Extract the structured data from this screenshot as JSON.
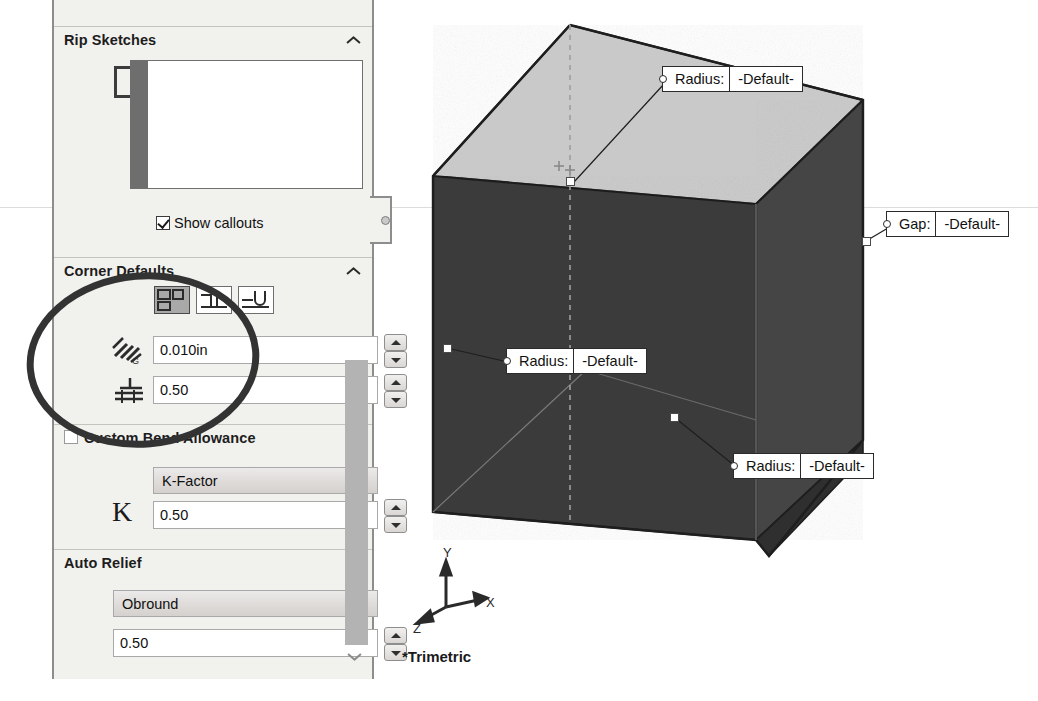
{
  "panel": {
    "name": "Sheet Metal PropertyManager",
    "groups": [
      {
        "id": "rip-sketches",
        "title": "Rip Sketches",
        "collapse_icon": "chevron-up-icon",
        "selection_icon": "rip-sketch-icon",
        "selection_box_value": "",
        "checkbox": {
          "label": "Show callouts",
          "checked": true
        }
      },
      {
        "id": "corner-defaults",
        "title": "Corner Defaults",
        "collapse_icon": "chevron-up-icon",
        "corner_types": [
          {
            "name": "default-relief-type",
            "selected": true
          },
          {
            "name": "rectangular-relief-type",
            "selected": false
          },
          {
            "name": "obround-relief-type",
            "selected": false
          }
        ],
        "fields": [
          {
            "icon": "bend-relief-gap-icon",
            "value": "0.010in",
            "spinner": true
          },
          {
            "icon": "relief-ratio-icon",
            "value": "0.50",
            "spinner": true
          }
        ]
      },
      {
        "id": "custom-bend-allowance",
        "title": "Custom Bend Allowance",
        "collapse_icon": "chevron-up-icon",
        "checkbox": {
          "label": "",
          "checked": false
        },
        "select": {
          "value": "K-Factor",
          "options": [
            "Bend Table",
            "K-Factor",
            "Bend Allowance",
            "Bend Deduction",
            "Bend Calculation"
          ]
        },
        "field": {
          "icon": "k-factor-icon",
          "icon_text": "K",
          "value": "0.50",
          "spinner": true
        }
      },
      {
        "id": "auto-relief",
        "title": "Auto Relief",
        "collapse_icon": "chevron-up-icon",
        "select": {
          "value": "Obround",
          "options": [
            "Rectangular",
            "Tear",
            "Obround"
          ]
        },
        "field": {
          "value": "0.50",
          "spinner": true
        }
      }
    ],
    "scrollbar": {
      "name": "panel-scrollbar",
      "arrow_icon": "chevron-down-icon"
    },
    "pin_icon": "panel-pin-icon"
  },
  "viewport": {
    "orientation_label": "*Trimetric",
    "triad": {
      "x": "X",
      "y": "Y",
      "z": "Z"
    },
    "callouts": [
      {
        "id": "callout-top-radius",
        "label": "Radius:",
        "value": "-Default-"
      },
      {
        "id": "callout-right-gap",
        "label": "Gap:",
        "value": "-Default-"
      },
      {
        "id": "callout-left-radius",
        "label": "Radius:",
        "value": "-Default-"
      },
      {
        "id": "callout-bottom-radius",
        "label": "Radius:",
        "value": "-Default-"
      }
    ],
    "colors": {
      "face_top": "#c8c8c8",
      "face_front": "#3a3a3a",
      "face_right": "#474747",
      "edge": "#1e1e1e",
      "construction": "#9a9a9a"
    }
  },
  "annotation": {
    "shape": "ellipse",
    "target": "corner-defaults-fields",
    "color": "#333333"
  }
}
